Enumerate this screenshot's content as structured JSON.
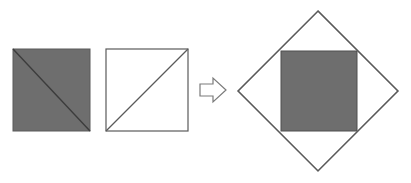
{
  "figure": {
    "canvas": {
      "width": 411,
      "height": 183,
      "background": "#ffffff"
    },
    "colors": {
      "gray_fill": "#6e6e6e",
      "outline": "#5a5a5a",
      "diagonal_stroke": "#3c3c3c",
      "white_fill": "#ffffff",
      "arrow_stroke": "#7a7a7a"
    },
    "shapes": {
      "shaded_square": {
        "label": "shaded square with diagonal",
        "x": 13,
        "y": 49,
        "width": 77,
        "height": 82,
        "fill": "#6e6e6e",
        "stroke": "#5a5a5a",
        "diagonal": "top-left-to-bottom-right"
      },
      "white_square": {
        "label": "white square with diagonal",
        "x": 106,
        "y": 49,
        "width": 82,
        "height": 82,
        "fill": "#ffffff",
        "stroke": "#5a5a5a",
        "diagonal": "bottom-left-to-top-right"
      },
      "arrow": {
        "label": "rightward block arrow",
        "direction": "right",
        "x": 200,
        "y": 78,
        "width": 26,
        "height": 24,
        "fill": "#ffffff",
        "stroke": "#7a7a7a"
      },
      "diamond": {
        "label": "rotated square (diamond) outline",
        "center_x": 318,
        "center_y": 91,
        "half_diagonal": 80,
        "vertices": [
          {
            "name": "top",
            "x": 318,
            "y": 11
          },
          {
            "name": "right",
            "x": 398,
            "y": 91
          },
          {
            "name": "bottom",
            "x": 318,
            "y": 171
          },
          {
            "name": "left",
            "x": 238,
            "y": 91
          }
        ],
        "fill": "#ffffff",
        "stroke": "#5a5a5a"
      },
      "inscribed_square": {
        "label": "shaded square overlapping the diamond",
        "x": 281,
        "y": 51,
        "width": 76,
        "height": 80,
        "fill": "#6e6e6e",
        "stroke": "#4f4f4f"
      }
    }
  }
}
